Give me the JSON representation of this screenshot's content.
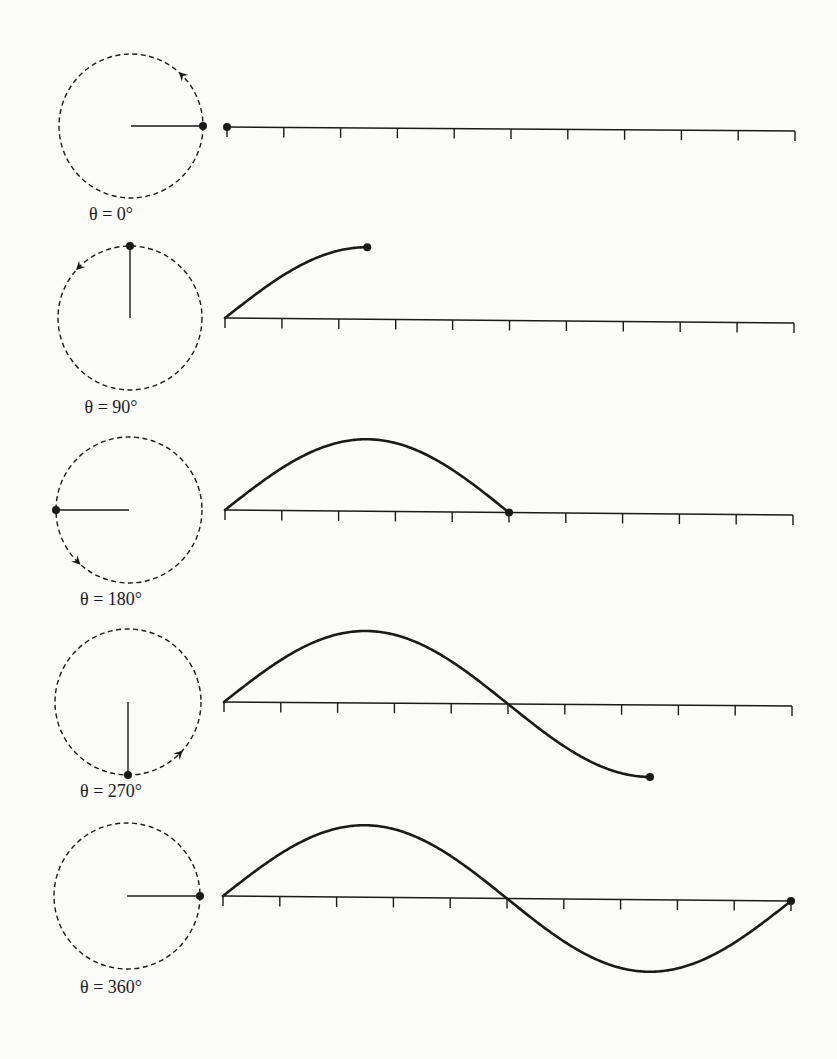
{
  "figure": {
    "colors": {
      "ink": "#1a1a1a",
      "background": "#fbfbfa"
    },
    "rows": [
      {
        "label": "θ = 0°",
        "angle_deg": 0,
        "circle": {
          "cx": 131,
          "cy": 126,
          "r": 72
        },
        "rotation_arrow": {
          "at_deg": 45,
          "direction": "counterclockwise"
        },
        "axis": {
          "x0": 227,
          "y0": 127,
          "x1": 795,
          "y1": 131
        },
        "label_pos": {
          "x": 111,
          "y": 204
        }
      },
      {
        "label": "θ = 90°",
        "angle_deg": 90,
        "circle": {
          "cx": 130,
          "cy": 318,
          "r": 72
        },
        "rotation_arrow": {
          "at_deg": 135,
          "direction": "counterclockwise"
        },
        "axis": {
          "x0": 225,
          "y0": 318,
          "x1": 794,
          "y1": 323
        },
        "label_pos": {
          "x": 111,
          "y": 397
        }
      },
      {
        "label": "θ = 180°",
        "angle_deg": 180,
        "circle": {
          "cx": 129,
          "cy": 510,
          "r": 73
        },
        "rotation_arrow": {
          "at_deg": 225,
          "direction": "counterclockwise"
        },
        "axis": {
          "x0": 225,
          "y0": 510,
          "x1": 793,
          "y1": 515
        },
        "label_pos": {
          "x": 111,
          "y": 589
        }
      },
      {
        "label": "θ = 270°",
        "angle_deg": 270,
        "circle": {
          "cx": 128,
          "cy": 702,
          "r": 73
        },
        "rotation_arrow": {
          "at_deg": 315,
          "direction": "counterclockwise"
        },
        "axis": {
          "x0": 224,
          "y0": 702,
          "x1": 792,
          "y1": 706
        },
        "label_pos": {
          "x": 111,
          "y": 781
        }
      },
      {
        "label": "θ = 360°",
        "angle_deg": 360,
        "circle": {
          "cx": 127,
          "cy": 896,
          "r": 73
        },
        "rotation_arrow": null,
        "axis": {
          "x0": 223,
          "y0": 896,
          "x1": 791,
          "y1": 901
        },
        "label_pos": {
          "x": 111,
          "y": 977
        }
      }
    ],
    "axis_ticks": 11,
    "tick_length": 10,
    "wave": {
      "amplitude_px": 72,
      "period_ticks": 10,
      "max_angle_deg": 360
    }
  }
}
